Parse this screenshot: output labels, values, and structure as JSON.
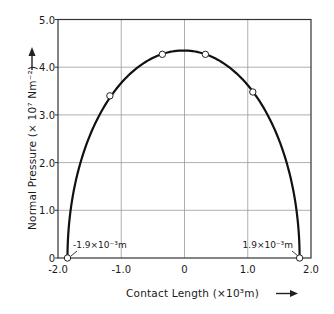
{
  "chart_data": {
    "type": "line",
    "title": "",
    "xlabel": "Contact Length (×10³m)",
    "ylabel": "Normal Pressure (×10⁷ Nm⁻²)",
    "xlim": [
      -2.0,
      2.0
    ],
    "ylim": [
      0,
      5.0
    ],
    "grid": true,
    "x_ticks": [
      "-2.0",
      "-1.0",
      "0",
      "1.0",
      "2.0"
    ],
    "y_ticks": [
      "0",
      "1.0",
      "2.0",
      "3.0",
      "4.0",
      "5.0"
    ],
    "x_tick_values": [
      -2.0,
      -1.0,
      0,
      1.0,
      2.0
    ],
    "y_tick_values": [
      0,
      1.0,
      2.0,
      3.0,
      4.0,
      5.0
    ],
    "series": [
      {
        "name": "Normal pressure distribution (curve)",
        "kind": "smooth-curve",
        "shape": "semi-elliptical",
        "peak_x": 0,
        "peak_y": 4.35,
        "half_width": 1.85
      },
      {
        "name": "Measured points",
        "kind": "markers",
        "marker": "open-circle",
        "x": [
          -1.85,
          -1.18,
          -0.35,
          0.33,
          1.08,
          1.82
        ],
        "y": [
          0,
          3.4,
          4.27,
          4.27,
          3.48,
          0
        ]
      }
    ],
    "annotations": [
      {
        "text": "-1.9×10⁻³m",
        "x": -1.85,
        "y": 0
      },
      {
        "text": "1.9×10⁻³m",
        "x": 1.82,
        "y": 0
      }
    ]
  },
  "labels": {
    "xlabel": "Contact Length  (×10³m)",
    "ylabel": "Normal  Pressure  (× 10⁷ Nm⁻²)",
    "annot_left": "-1.9×10⁻³m",
    "annot_right": "1.9×10⁻³m"
  },
  "colors": {
    "curve": "#111111",
    "grid": "#9a9a9a",
    "axis": "#333333",
    "marker_fill": "#ffffff"
  }
}
